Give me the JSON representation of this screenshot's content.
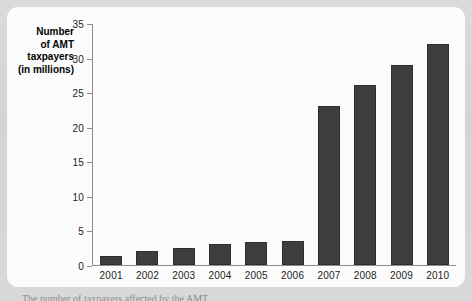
{
  "chart_data": {
    "type": "bar",
    "title": "",
    "xlabel": "",
    "ylabel": "Number of AMT taxpayers (in millions)",
    "ylabel_lines": [
      "Number",
      "of AMT",
      "taxpayers",
      "(in millions)"
    ],
    "categories": [
      "2001",
      "2002",
      "2003",
      "2004",
      "2005",
      "2006",
      "2007",
      "2008",
      "2009",
      "2010"
    ],
    "values": [
      1.3,
      2,
      2.4,
      3,
      3.4,
      3.5,
      23,
      26,
      29,
      32
    ],
    "ylim": [
      0,
      35
    ],
    "yticks": [
      0,
      5,
      10,
      15,
      20,
      25,
      30,
      35
    ],
    "ytick_labels": [
      "0",
      "5",
      "10",
      "15",
      "20",
      "25",
      "30",
      "35"
    ],
    "grid": false,
    "legend": null,
    "bar_color": "#3d3d3d",
    "axis_color": "#8e8e8e"
  },
  "caption": "The number of taxpayers affected by the AMT",
  "page": {
    "background_color": "#d8d8d8",
    "card_color": "#fdfdfd"
  }
}
